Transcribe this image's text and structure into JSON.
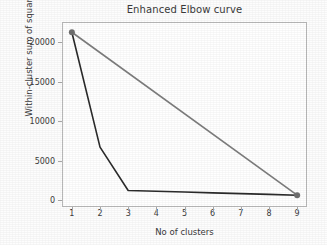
{
  "chart_data": {
    "type": "line",
    "title": "Enhanced Elbow curve",
    "xlabel": "No of clusters",
    "ylabel": "Within-cluster sum of squares",
    "x": [
      1,
      2,
      3,
      4,
      5,
      6,
      7,
      8,
      9
    ],
    "xtick_labels": [
      "1",
      "2",
      "3",
      "4",
      "5",
      "6",
      "7",
      "8",
      "9"
    ],
    "ytick_labels": [
      "0",
      "5000",
      "10000",
      "15000",
      "20000"
    ],
    "ytick_values": [
      0,
      5000,
      10000,
      15000,
      20000
    ],
    "xlim": [
      0.65,
      9.35
    ],
    "ylim": [
      -900,
      22600
    ],
    "grid": false,
    "legend": null,
    "series": [
      {
        "name": "elbow-curve",
        "color": "#2b2b2b",
        "values": [
          21300,
          6700,
          1200,
          1100,
          1000,
          900,
          800,
          700,
          600
        ],
        "markers": false
      },
      {
        "name": "reference-line",
        "color": "#7d7d7d",
        "x": [
          1,
          9
        ],
        "values": [
          21300,
          600
        ],
        "markers": true,
        "marker_color": "#6f6f6f"
      }
    ]
  },
  "figure": {
    "background_color": "#ffffff",
    "axes_color": "#b9b9b9",
    "text_color": "#3a3a3a"
  }
}
